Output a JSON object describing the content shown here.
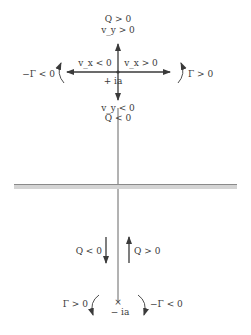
{
  "diagram": {
    "colors": {
      "ink": "#3a3a3a",
      "wall": "#9a9a9a",
      "wall_shade": "#cfcfcf"
    },
    "upper_point": {
      "label": "+ ia",
      "up_label_1": "Q > 0",
      "up_label_2": "v_y > 0",
      "left_label": "v_x < 0",
      "right_label": "v_x > 0",
      "down_label_1": "v_y < 0",
      "down_label_2": "Q < 0",
      "left_circulation": "−Γ < 0",
      "right_circulation": "Γ > 0"
    },
    "lower_point": {
      "marker": "×",
      "label": "− ia",
      "down_flow_label": "Q < 0",
      "up_flow_label": "Q > 0",
      "left_circulation": "Γ > 0",
      "right_circulation": "−Γ < 0"
    }
  }
}
